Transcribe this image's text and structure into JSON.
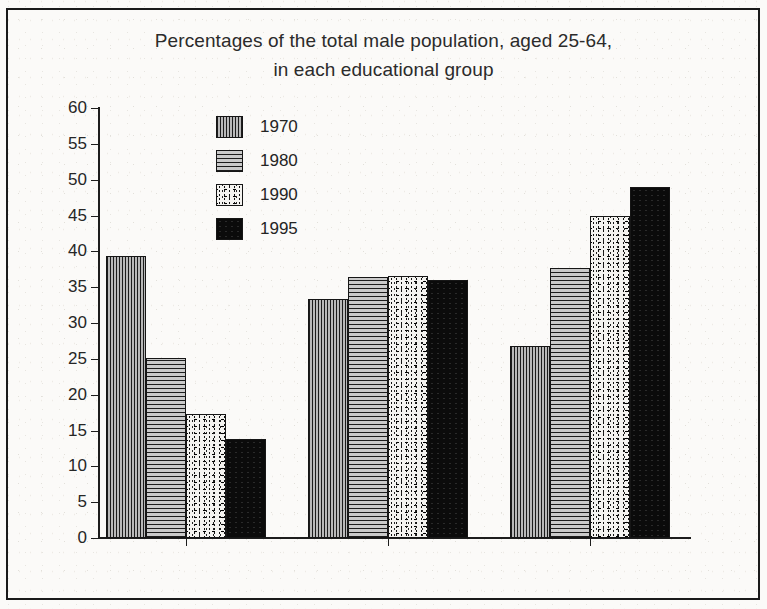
{
  "chart_data": {
    "type": "bar",
    "title": "Percentages of the total male population, aged 25-64, in each educational group",
    "title_line1": "Percentages of the total male population, aged 25-64,",
    "title_line2": "in each educational group",
    "xlabel": "",
    "ylabel": "",
    "ylim": [
      0,
      60
    ],
    "ytick_step": 5,
    "yticks": [
      0,
      5,
      10,
      15,
      20,
      25,
      30,
      35,
      40,
      45,
      50,
      55,
      60
    ],
    "grid": false,
    "legend_position": "upper-left-inside",
    "categories": [
      "Low-Ed",
      "Mid-Ed",
      "High-Ed"
    ],
    "series": [
      {
        "name": "1970",
        "pattern": "vertical-lines",
        "values": [
          39.3,
          33.3,
          26.8
        ]
      },
      {
        "name": "1980",
        "pattern": "horizontal-lines",
        "values": [
          25.1,
          36.4,
          37.7
        ]
      },
      {
        "name": "1990",
        "pattern": "speckled-dots",
        "values": [
          17.3,
          36.6,
          45.0
        ]
      },
      {
        "name": "1995",
        "pattern": "solid-black",
        "values": [
          13.8,
          36.0,
          49.0
        ]
      }
    ]
  },
  "colors": {
    "axis": "#1d1d1d",
    "text": "#242424",
    "frame": "#1a1a1a",
    "background": "#fbfaf8"
  }
}
